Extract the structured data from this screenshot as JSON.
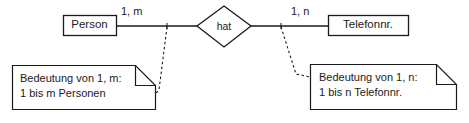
{
  "diagram": {
    "type": "er-diagram",
    "language": "de",
    "background_color": "#ffffff",
    "stroke_color": "#1a1a1a",
    "entities": [
      {
        "id": "person",
        "label": "Person",
        "shape": "rectangle",
        "x": 63,
        "y": 15,
        "w": 53,
        "h": 21
      },
      {
        "id": "telefonnr",
        "label": "Telefonnr.",
        "shape": "rectangle",
        "x": 328,
        "y": 15,
        "w": 80,
        "h": 21
      }
    ],
    "relationships": [
      {
        "id": "hat",
        "label": "hat",
        "shape": "diamond",
        "cx": 224,
        "cy": 27,
        "rx": 27,
        "ry": 20
      }
    ],
    "cardinalities": [
      {
        "id": "left",
        "label": "1, m",
        "x": 128,
        "y": 6
      },
      {
        "id": "right",
        "label": "1, n",
        "x": 296,
        "y": 6
      }
    ],
    "notes": [
      {
        "id": "note-left",
        "line1": "Bedeutung von 1, m:",
        "line2": "1 bis m Personen",
        "x": 12,
        "y": 65,
        "w": 143,
        "h": 45,
        "fold": 20
      },
      {
        "id": "note-right",
        "line1": "Bedeutung von 1, n:",
        "line2": "1 bis n Telefonnr.",
        "x": 310,
        "y": 64,
        "w": 146,
        "h": 46,
        "fold": 20
      }
    ],
    "connectors": [
      {
        "id": "person-to-hat",
        "style": "solid",
        "from": "person",
        "to": "hat"
      },
      {
        "id": "hat-to-telefonnr",
        "style": "solid",
        "from": "hat",
        "to": "telefonnr"
      },
      {
        "id": "note-left-link",
        "style": "dashed",
        "from": "note-left",
        "to": "person-to-hat"
      },
      {
        "id": "note-right-link",
        "style": "dashed",
        "from": "note-right",
        "to": "hat-to-telefonnr"
      }
    ]
  }
}
